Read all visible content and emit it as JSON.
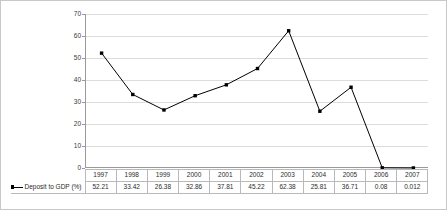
{
  "chart_data": {
    "type": "line",
    "title": "",
    "xlabel": "",
    "ylabel": "",
    "categories": [
      "1997",
      "1998",
      "1999",
      "2000",
      "2001",
      "2002",
      "2003",
      "2004",
      "2005",
      "2006",
      "2007"
    ],
    "series": [
      {
        "name": "Deposit to GDP (%)",
        "values": [
          52.21,
          33.42,
          26.38,
          32.86,
          37.81,
          45.22,
          62.38,
          25.81,
          36.71,
          0.08,
          0.012
        ],
        "display_values": [
          "52.21",
          "33.42",
          "26.38",
          "32.86",
          "37.81",
          "45.22",
          "62.38",
          "25.81",
          "36.71",
          "0.08",
          "0.012"
        ],
        "color": "#000000",
        "marker": "square"
      }
    ],
    "ylim": [
      0,
      70
    ],
    "ytick_step": 10,
    "ytick_labels": [
      "0",
      "10",
      "20",
      "30",
      "40",
      "50",
      "60",
      "70"
    ],
    "grid": true,
    "grid_color": "#dcdcdc",
    "legend_position": "bottom-table",
    "data_table_visible": true
  },
  "legend": {
    "series_label": "Deposit to GDP (%)"
  },
  "colors": {
    "frame_border": "#c8c8c8",
    "axis": "#9a9a9a",
    "gridline": "#dcdcdc",
    "series": "#000000",
    "table_border": "#b9b9b9",
    "text": "#2b2b2b"
  }
}
